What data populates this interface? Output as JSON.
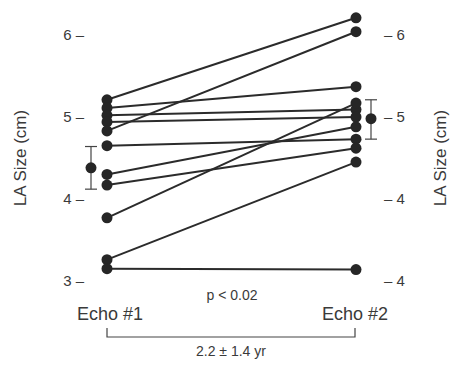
{
  "chart_data": {
    "type": "line",
    "title": "",
    "categories": [
      "Echo #1",
      "Echo #2"
    ],
    "ylabel_left": "LA Size (cm)",
    "ylabel_right": "LA Size (cm)",
    "ylim": [
      3,
      6.2
    ],
    "left_ticks": [
      {
        "value": 6,
        "label": "6 –"
      },
      {
        "value": 5,
        "label": "5 –"
      },
      {
        "value": 4,
        "label": "4 –"
      },
      {
        "value": 3,
        "label": "3 –"
      }
    ],
    "right_ticks": [
      {
        "value": 6,
        "label": "– 6"
      },
      {
        "value": 5,
        "label": "– 5"
      },
      {
        "value": 4,
        "label": "– 4"
      },
      {
        "value": 3,
        "label": "– 4"
      }
    ],
    "series": [
      {
        "name": "patient-1",
        "values": [
          5.21,
          6.21
        ]
      },
      {
        "name": "patient-2",
        "values": [
          5.11,
          5.37
        ]
      },
      {
        "name": "patient-3",
        "values": [
          5.02,
          5.09
        ]
      },
      {
        "name": "patient-4",
        "values": [
          4.94,
          5.0
        ]
      },
      {
        "name": "patient-5",
        "values": [
          4.83,
          6.04
        ]
      },
      {
        "name": "patient-6",
        "values": [
          4.65,
          4.73
        ]
      },
      {
        "name": "patient-7",
        "values": [
          4.3,
          4.88
        ]
      },
      {
        "name": "patient-8",
        "values": [
          4.17,
          4.62
        ]
      },
      {
        "name": "patient-9",
        "values": [
          3.77,
          5.17
        ]
      },
      {
        "name": "patient-10",
        "values": [
          3.26,
          4.45
        ]
      },
      {
        "name": "patient-11",
        "values": [
          3.15,
          3.14
        ]
      }
    ],
    "summary": [
      {
        "category": "Echo #1",
        "mean": 4.38,
        "lower": 4.12,
        "upper": 4.64
      },
      {
        "category": "Echo #2",
        "mean": 4.98,
        "lower": 4.73,
        "upper": 5.21
      }
    ],
    "annotations": {
      "p_value": "p < 0.02",
      "interval": "2.2 ± 1.4 yr"
    },
    "grid": false,
    "legend": "none",
    "colors": {
      "marker": "#262626",
      "line": "#2b2b2b",
      "text": "#3a3a3a"
    }
  }
}
